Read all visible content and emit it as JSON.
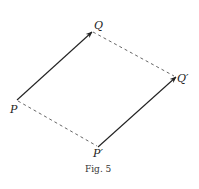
{
  "figure": {
    "caption": "Fig. 5",
    "points": {
      "P": {
        "label": "P",
        "x": 17,
        "y": 100
      },
      "Q": {
        "label": "Q",
        "x": 92,
        "y": 32
      },
      "Qp": {
        "label": "Q′",
        "x": 176,
        "y": 77
      },
      "Pp": {
        "label": "P′",
        "x": 98,
        "y": 147
      }
    },
    "edges": [
      {
        "from": "P",
        "to": "Q",
        "style": "solid-arrow"
      },
      {
        "from": "Pp",
        "to": "Qp",
        "style": "solid-arrow"
      },
      {
        "from": "Q",
        "to": "Qp",
        "style": "dashed"
      },
      {
        "from": "P",
        "to": "Pp",
        "style": "dashed"
      }
    ],
    "colors": {
      "line": "#222222",
      "dashed": "#555555",
      "background": "#ffffff"
    }
  }
}
